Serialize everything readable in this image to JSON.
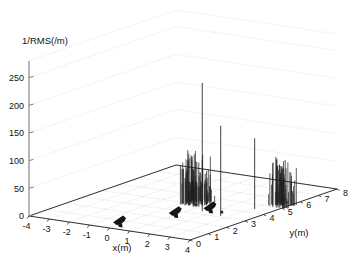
{
  "figure": {
    "background": "#ffffff",
    "axis_color": "#1a1a1a",
    "grid_color": "#b9b9b9",
    "wall_grid_color": "#c9c9c9",
    "stem_color": "#202020"
  },
  "chart_data": {
    "type": "scatter",
    "projection": "3d",
    "title": "",
    "zlabel": "1/RMS(/m)",
    "xlabel": "x(m)",
    "ylabel": "y(m)",
    "xticks": [
      -4,
      -3,
      -2,
      -1,
      0,
      1,
      2,
      3,
      4
    ],
    "xticklabels": [
      "-4",
      "-3",
      "-2",
      "-1",
      "0",
      "1",
      "2",
      "3",
      "4"
    ],
    "yticks": [
      0,
      1,
      2,
      3,
      4,
      5,
      6,
      7,
      8
    ],
    "yticklabels": [
      "0",
      "1",
      "2",
      "3",
      "4",
      "5",
      "6",
      "7",
      "8"
    ],
    "zticks": [
      0,
      50,
      100,
      150,
      200,
      250
    ],
    "zticklabels": [
      "0",
      "50",
      "100",
      "150",
      "200",
      "250"
    ],
    "xlim": [
      -4,
      4
    ],
    "ylim": [
      0,
      8
    ],
    "zlim": [
      0,
      280
    ],
    "grid": true,
    "legend": null,
    "series": [
      {
        "name": "spike-cluster-A",
        "kind": "stem-cluster",
        "x": 0.55,
        "y": 4.15,
        "peak": 95,
        "spread_x": 0.55,
        "spread_y": 0.45,
        "count": 46,
        "values": [
          18,
          26,
          34,
          52,
          70,
          62,
          80,
          88,
          95,
          84,
          76,
          90,
          72,
          64,
          58,
          50,
          44,
          40,
          36,
          30,
          24,
          20,
          16,
          30,
          46,
          60,
          74,
          86,
          92,
          78,
          66,
          54,
          42,
          34,
          28,
          22,
          18,
          14,
          24,
          38,
          48,
          56,
          44,
          32,
          20,
          12
        ]
      },
      {
        "name": "spike-tall-1",
        "kind": "stem",
        "x": 1.55,
        "y": 3.35,
        "value": 232
      },
      {
        "name": "spike-tall-2",
        "kind": "stem",
        "x": 2.65,
        "y": 3.15,
        "value": 163
      },
      {
        "name": "spike-tall-3",
        "kind": "stem",
        "x": 3.15,
        "y": 4.45,
        "value": 128
      },
      {
        "name": "spike-cluster-B",
        "kind": "stem-cluster",
        "x": 3.75,
        "y": 5.3,
        "peak": 86,
        "spread_x": 0.5,
        "spread_y": 0.35,
        "count": 30,
        "values": [
          20,
          36,
          54,
          68,
          80,
          86,
          78,
          70,
          84,
          76,
          62,
          58,
          72,
          66,
          50,
          44,
          56,
          48,
          38,
          30,
          42,
          52,
          60,
          46,
          34,
          26,
          18,
          28,
          22,
          14
        ]
      },
      {
        "name": "marker-arrow-1",
        "kind": "marker",
        "x": -0.55,
        "y": 1.15,
        "value": 0
      },
      {
        "name": "marker-arrow-2",
        "kind": "marker",
        "x": 1.9,
        "y": 1.5,
        "value": 26
      },
      {
        "name": "marker-arrow-3",
        "kind": "marker",
        "x": 2.85,
        "y": 2.35,
        "value": 30
      },
      {
        "name": "marker-small-1",
        "kind": "marker",
        "x": 1.15,
        "y": 3.45,
        "value": 8
      },
      {
        "name": "marker-small-2",
        "kind": "marker",
        "x": 2.75,
        "y": 3.1,
        "value": 8
      },
      {
        "name": "marker-small-3",
        "kind": "marker",
        "x": 3.95,
        "y": 5.15,
        "value": 6
      }
    ]
  }
}
